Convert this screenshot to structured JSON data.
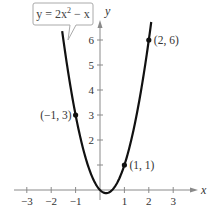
{
  "chart_data": {
    "type": "line",
    "title": "",
    "equation_label": "y = 2x² − x",
    "equation_parts": {
      "prefix": "y = 2x",
      "exponent": "2",
      "suffix": " − x"
    },
    "function": "y = 2x^2 - x",
    "xlabel": "x",
    "ylabel": "y",
    "xlim": [
      -3.5,
      3.9
    ],
    "ylim": [
      -0.5,
      6.8
    ],
    "grid": false,
    "legend": "none",
    "x_ticks": [
      -3,
      -2,
      -1,
      1,
      2,
      3
    ],
    "x_tick_labels": [
      "−3",
      "−2",
      "−1",
      "1",
      "2",
      "3"
    ],
    "y_ticks": [
      1,
      2,
      3,
      4,
      5,
      6
    ],
    "y_tick_labels": [
      "",
      "2",
      "3",
      "4",
      "5",
      "6"
    ],
    "series": [
      {
        "name": "y = 2x² − x",
        "x_range": [
          -1.55,
          2.1
        ],
        "color": "#111111"
      }
    ],
    "labeled_points": [
      {
        "x": -1,
        "y": 3,
        "label": "(−1, 3)",
        "label_side": "left"
      },
      {
        "x": 1,
        "y": 1,
        "label": "(1, 1)",
        "label_side": "right"
      },
      {
        "x": 2,
        "y": 6,
        "label": "(2, 6)",
        "label_side": "right"
      }
    ]
  },
  "style": {
    "axis_color": "#8a8a8a",
    "curve_color": "#111111",
    "callout_border": "#aaaaaa"
  }
}
